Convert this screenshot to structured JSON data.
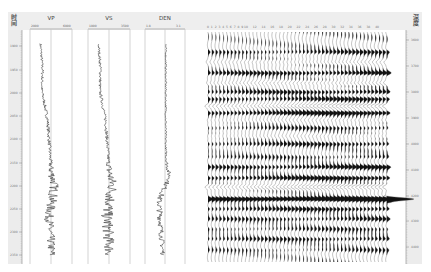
{
  "chart_data": {
    "type": "line",
    "title": "",
    "left_axis": {
      "label": "时间",
      "ticks": [
        "1900",
        "1950",
        "2000",
        "2050",
        "2100",
        "2150",
        "2200",
        "2250",
        "2300",
        "2350"
      ],
      "tick_y": [
        46,
        70,
        93,
        116,
        139,
        163,
        186,
        209,
        232,
        255
      ]
    },
    "right_axis": {
      "label": "深度",
      "ticks": [
        "3600",
        "3700",
        "3800",
        "3900",
        "4000",
        "4100",
        "4200",
        "4300",
        "4400"
      ],
      "tick_y": [
        40,
        66,
        92,
        118,
        144,
        170,
        196,
        221,
        247
      ]
    },
    "tracks": [
      {
        "name": "VP",
        "scale_min": "2000",
        "scale_max": "6000",
        "x0": 30,
        "x1": 72,
        "profile": [
          [
            44,
            0.25
          ],
          [
            70,
            0.3
          ],
          [
            90,
            0.28
          ],
          [
            105,
            0.35
          ],
          [
            120,
            0.42
          ],
          [
            150,
            0.47
          ],
          [
            170,
            0.5
          ],
          [
            185,
            0.58
          ],
          [
            195,
            0.55
          ],
          [
            215,
            0.45
          ],
          [
            255,
            0.52
          ]
        ],
        "noise": [
          [
            44,
            0.03
          ],
          [
            160,
            0.04
          ],
          [
            175,
            0.1
          ],
          [
            195,
            0.12
          ],
          [
            255,
            0.1
          ]
        ]
      },
      {
        "name": "VS",
        "scale_min": "1000",
        "scale_max": "3500",
        "x0": 88,
        "x1": 130,
        "profile": [
          [
            44,
            0.25
          ],
          [
            70,
            0.3
          ],
          [
            90,
            0.28
          ],
          [
            105,
            0.35
          ],
          [
            120,
            0.42
          ],
          [
            150,
            0.47
          ],
          [
            170,
            0.5
          ],
          [
            185,
            0.58
          ],
          [
            195,
            0.55
          ],
          [
            215,
            0.45
          ],
          [
            255,
            0.52
          ]
        ],
        "noise": [
          [
            44,
            0.03
          ],
          [
            160,
            0.04
          ],
          [
            175,
            0.12
          ],
          [
            195,
            0.15
          ],
          [
            255,
            0.13
          ]
        ]
      },
      {
        "name": "DEN",
        "scale_min": "1.8",
        "scale_max": "3.1",
        "x0": 145,
        "x1": 185,
        "profile": [
          [
            44,
            0.52
          ],
          [
            110,
            0.52
          ],
          [
            150,
            0.52
          ],
          [
            165,
            0.55
          ],
          [
            178,
            0.62
          ],
          [
            185,
            0.52
          ],
          [
            200,
            0.35
          ],
          [
            230,
            0.4
          ],
          [
            255,
            0.45
          ]
        ],
        "noise": [
          [
            44,
            0.02
          ],
          [
            150,
            0.02
          ],
          [
            170,
            0.05
          ],
          [
            200,
            0.08
          ],
          [
            255,
            0.06
          ]
        ]
      }
    ],
    "seismic": {
      "trace_labels": [
        "0",
        "1",
        "2",
        "3",
        "4",
        "5",
        "6",
        "7",
        "8",
        "9",
        "10",
        "12",
        "14",
        "16",
        "18",
        "20",
        "22",
        "24",
        "26",
        "28",
        "30",
        "32",
        "34",
        "36",
        "38",
        "40"
      ],
      "trace_count": 48,
      "x_start": 208,
      "spacing": 3.8,
      "y_top": 32,
      "y_bottom": 262,
      "reflectors": [
        {
          "y": 52,
          "amp": 0.7
        },
        {
          "y": 62,
          "amp": -0.5
        },
        {
          "y": 73,
          "amp": 1.0
        },
        {
          "y": 83,
          "amp": -0.7
        },
        {
          "y": 92,
          "amp": 0.9
        },
        {
          "y": 99,
          "amp": 0.9
        },
        {
          "y": 106,
          "amp": -1.3
        },
        {
          "y": 113,
          "amp": 1.2
        },
        {
          "y": 120,
          "amp": -0.5
        },
        {
          "y": 128,
          "amp": 0.6
        },
        {
          "y": 136,
          "amp": -0.4
        },
        {
          "y": 144,
          "amp": 0.8
        },
        {
          "y": 157,
          "amp": 0.5
        },
        {
          "y": 167,
          "amp": 1.0
        },
        {
          "y": 178,
          "amp": 1.1
        },
        {
          "y": 187,
          "amp": -1.3
        },
        {
          "y": 199,
          "amp": 2.0
        },
        {
          "y": 209,
          "amp": 0.9
        },
        {
          "y": 219,
          "amp": 0.7
        },
        {
          "y": 229,
          "amp": 0.5
        },
        {
          "y": 239,
          "amp": 0.7
        },
        {
          "y": 250,
          "amp": 0.4
        }
      ]
    }
  }
}
